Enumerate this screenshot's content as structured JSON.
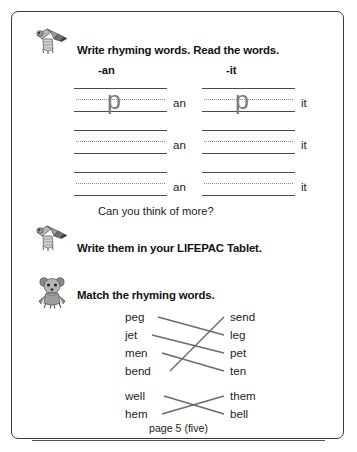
{
  "page": {
    "border_color": "#3a3a3a",
    "background": "#ffffff",
    "footer_label": "page 5 (five)"
  },
  "section_write": {
    "icon": "mouse-with-pencil-icon",
    "heading": "Write rhyming words. Read the words.",
    "columns": [
      {
        "label": "-an",
        "suffix": "an",
        "rows": [
          {
            "letter": "p"
          },
          {
            "letter": ""
          },
          {
            "letter": ""
          }
        ]
      },
      {
        "label": "-it",
        "suffix": "it",
        "rows": [
          {
            "letter": "p"
          },
          {
            "letter": ""
          },
          {
            "letter": ""
          }
        ]
      }
    ]
  },
  "section_more": {
    "question": "Can you think of more?",
    "icon": "mouse-with-pencil-icon",
    "heading": "Write them in your LIFEPAC Tablet."
  },
  "section_match": {
    "icon": "standing-mouse-icon",
    "heading": "Match the rhyming words.",
    "left_words": [
      "peg",
      "jet",
      "men",
      "bend",
      "well",
      "hem"
    ],
    "right_words": [
      "send",
      "leg",
      "pet",
      "ten",
      "them",
      "bell"
    ],
    "connections": [
      {
        "from": "peg",
        "to": "leg"
      },
      {
        "from": "jet",
        "to": "pet"
      },
      {
        "from": "men",
        "to": "ten"
      },
      {
        "from": "bend",
        "to": "send"
      },
      {
        "from": "well",
        "to": "bell"
      },
      {
        "from": "hem",
        "to": "them"
      }
    ],
    "line_color": "#6b6b6b"
  }
}
